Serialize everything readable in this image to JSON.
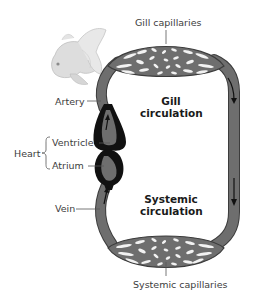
{
  "diagram": {
    "labels": {
      "gill_capillaries": "Gill capillaries",
      "systemic_capillaries": "Systemic capillaries",
      "artery": "Artery",
      "heart": "Heart",
      "ventricle": "Ventricle",
      "atrium": "Atrium",
      "vein": "Vein"
    },
    "regions": {
      "gill_circulation": [
        "Gill",
        "circulation"
      ],
      "systemic_circulation": [
        "Systemic",
        "circulation"
      ]
    },
    "illustration": "goldfish",
    "colors": {
      "vessel_fill": "#6e6e6e",
      "vessel_outline": "#3c3c3c",
      "heart": "#111111",
      "capillary_gaps": "#f2f2f2",
      "leader_line": "#555555"
    },
    "flow_arrows": {
      "left_vessel": "up",
      "right_vessel": "down"
    }
  }
}
